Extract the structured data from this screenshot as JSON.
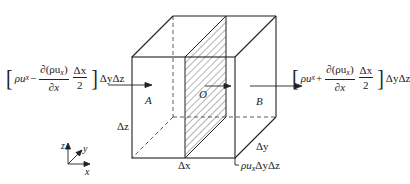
{
  "diagram": {
    "type": "control-volume-mass-flux",
    "labels": {
      "point_a": "A",
      "point_o": "O",
      "point_b": "B",
      "dz": "Δz",
      "dx": "Δx",
      "dy": "Δy",
      "center_flux": "ρu",
      "center_flux_sub": "x",
      "center_flux_area": "ΔyΔz"
    },
    "left_flux": {
      "rho_u": "ρu",
      "sub": "x",
      "sign": "−",
      "deriv_num": "∂(ρu",
      "deriv_num_sub": "x",
      "deriv_num_close": ")",
      "deriv_den": "∂x",
      "half_num": "Δx",
      "half_den": "2",
      "area": "ΔyΔz"
    },
    "right_flux": {
      "rho_u": "ρu",
      "sub": "x",
      "sign": "+",
      "deriv_num": "∂(ρu",
      "deriv_num_sub": "x",
      "deriv_num_close": ")",
      "deriv_den": "∂x",
      "half_num": "Δx",
      "half_den": "2",
      "area": "ΔyΔz"
    },
    "axes": {
      "x": "x",
      "y": "y",
      "z": "z"
    },
    "colors": {
      "line": "#222222",
      "hatch": "#444444",
      "background": "#ffffff"
    }
  }
}
